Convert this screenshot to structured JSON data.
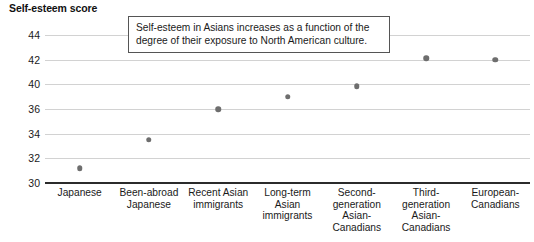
{
  "chart_data": {
    "type": "scatter",
    "title": "",
    "ylabel": "Self-esteem score",
    "xlabel": "",
    "ylim": [
      30,
      45
    ],
    "grid": true,
    "legend": false,
    "ytick_labels": [
      "44",
      "42",
      "40",
      "36",
      "34",
      "32",
      "30"
    ],
    "ytick_values": [
      44,
      42,
      40,
      36,
      34,
      32,
      30
    ],
    "categories": [
      "Japanese",
      "Been-abroad\nJapanese",
      "Recent Asian\nimmigrants",
      "Long-term\nAsian\nimmigrants",
      "Second-\ngeneration\nAsian-\nCanadians",
      "Third-\ngeneration\nAsian-\nCanadians",
      "European-\nCanadians"
    ],
    "values": [
      31.2,
      33.5,
      36.0,
      38.0,
      39.7,
      42.1,
      42.0
    ],
    "annotations": [
      "Self-esteem in Asians increases as a function of the degree of their exposure to North American culture."
    ],
    "marker_color": "#6e6e6e",
    "gridline_color": "#d2d2d2",
    "axis_color": "#2b2b2b"
  }
}
